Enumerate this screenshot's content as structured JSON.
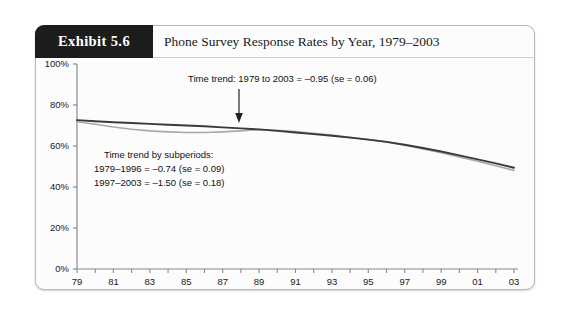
{
  "exhibit": {
    "badge": "Exhibit 5.6",
    "title": "Phone Survey Response Rates by Year, 1979–2003"
  },
  "annotations": {
    "overall_trend": "Time trend: 1979 to 2003 = –0.95 (se = 0.06)",
    "subperiod_heading": "Time trend by subperiods:",
    "subperiod_1": "1979–1996 = –0.74 (se = 0.09)",
    "subperiod_2": "1997–2003 = –1.50 (se = 0.18)",
    "arrow_name": "down-arrow-annotation"
  },
  "chart_data": {
    "type": "line",
    "title": "Phone Survey Response Rates by Year, 1979–2003",
    "xlabel": "Year of Survey",
    "ylabel": "",
    "xlim": [
      1979,
      2003
    ],
    "ylim": [
      0,
      100
    ],
    "grid": false,
    "legend": "none",
    "ytick_labels": [
      "100%",
      "80%",
      "60%",
      "40%",
      "20%",
      "0%"
    ],
    "ytick_values": [
      100,
      80,
      60,
      40,
      20,
      0
    ],
    "xtick_values": [
      1979,
      1980,
      1981,
      1982,
      1983,
      1984,
      1985,
      1986,
      1987,
      1988,
      1989,
      1990,
      1991,
      1992,
      1993,
      1994,
      1995,
      1996,
      1997,
      1998,
      1999,
      2000,
      2001,
      2002,
      2003
    ],
    "xtick_labels": [
      "79",
      "",
      "81",
      "",
      "83",
      "",
      "85",
      "",
      "87",
      "",
      "89",
      "",
      "91",
      "",
      "93",
      "",
      "95",
      "",
      "97",
      "",
      "99",
      "",
      "01",
      "",
      "03"
    ],
    "x": [
      1979,
      1980,
      1981,
      1982,
      1983,
      1984,
      1985,
      1986,
      1987,
      1988,
      1989,
      1990,
      1991,
      1992,
      1993,
      1994,
      1995,
      1996,
      1997,
      1998,
      1999,
      2000,
      2001,
      2002,
      2003
    ],
    "series": [
      {
        "name": "response-rate-dark",
        "color": "#3a3a3a",
        "values": [
          72.6,
          72.1,
          71.6,
          71.2,
          70.8,
          70.4,
          70.0,
          69.6,
          69.1,
          68.6,
          68.1,
          67.4,
          66.6,
          65.8,
          65.0,
          64.1,
          63.1,
          62.0,
          60.6,
          59.0,
          57.3,
          55.4,
          53.5,
          51.5,
          49.4
        ]
      },
      {
        "name": "response-rate-gray",
        "color": "#a8a8a8",
        "values": [
          71.8,
          70.6,
          69.3,
          68.2,
          67.4,
          66.9,
          66.6,
          66.6,
          66.9,
          67.4,
          68.0,
          67.6,
          67.0,
          66.2,
          65.3,
          64.3,
          63.2,
          62.0,
          60.4,
          58.6,
          56.7,
          54.7,
          52.6,
          50.4,
          48.1
        ]
      }
    ]
  }
}
